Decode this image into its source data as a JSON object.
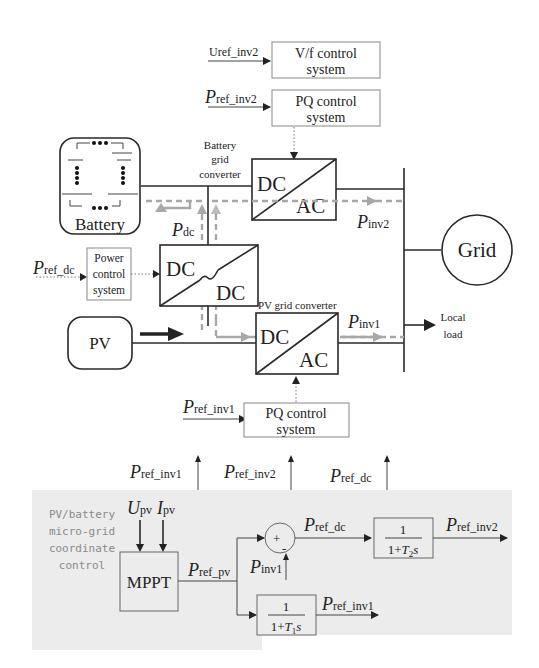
{
  "top_controls": {
    "vf": {
      "input_label": "Uref_inv2",
      "line1": "V/f control",
      "line2": "system"
    },
    "pq2": {
      "input_P": "P",
      "input_sub": "ref_inv2",
      "line1": "PQ control",
      "line2": "system"
    }
  },
  "battery": {
    "label": "Battery"
  },
  "battery_converter": {
    "caption1": "Battery",
    "caption2": "grid",
    "caption3": "converter",
    "left": "DC",
    "right": "AC"
  },
  "dcdc": {
    "left": "DC",
    "right": "DC"
  },
  "power_control": {
    "input_P": "P",
    "input_sub": "ref_dc",
    "line1": "Power",
    "line2": "control",
    "line3": "system"
  },
  "pdc_label": {
    "P": "P",
    "sub": "dc"
  },
  "pinv2_label": {
    "P": "P",
    "sub": "inv2"
  },
  "pinv1_label": {
    "P": "P",
    "sub": "inv1"
  },
  "grid": {
    "label": "Grid"
  },
  "local_load": {
    "line1": "Local",
    "line2": "load"
  },
  "pv": {
    "label": "PV"
  },
  "pv_converter": {
    "caption": "PV grid converter",
    "left": "DC",
    "right": "AC"
  },
  "pq1": {
    "input_P": "P",
    "input_sub": "ref_inv1",
    "line1": "PQ control",
    "line2": "system"
  },
  "outputs": [
    {
      "P": "P",
      "sub": "ref_inv1"
    },
    {
      "P": "P",
      "sub": "ref_inv2"
    },
    {
      "P": "P",
      "sub": "ref_dc"
    }
  ],
  "coordinator": {
    "title_lines": [
      "PV/battery",
      "micro-grid",
      "coordinate",
      "control"
    ],
    "inputs": {
      "U": "U",
      "U_sub": "pv",
      "I": "I",
      "I_sub": "pv"
    },
    "mppt": "MPPT",
    "pref_pv": {
      "P": "P",
      "sub": "ref_pv"
    },
    "sum_plus": "+",
    "sum_minus": "-",
    "pinv1": {
      "P": "P",
      "sub": "inv1"
    },
    "pref_dc": {
      "P": "P",
      "sub": "ref_dc"
    },
    "tf2": {
      "num": "1",
      "den_pre": "1+",
      "den_T": "T",
      "den_sub": "2",
      "den_s": "s"
    },
    "pref_inv2": {
      "P": "P",
      "sub": "ref_inv2"
    },
    "tf1": {
      "num": "1",
      "den_pre": "1+",
      "den_T": "T",
      "den_sub": "1",
      "den_s": "s"
    },
    "pref_inv1": {
      "P": "P",
      "sub": "ref_inv1"
    }
  }
}
